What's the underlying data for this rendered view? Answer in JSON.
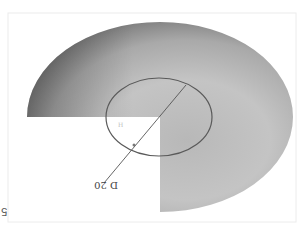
{
  "figure": {
    "orientation": "rotated-180",
    "frame_color": "#e6e6e6",
    "disc": {
      "description": "three-quarter disc with quarter cut-out",
      "shade_dark": "#6e6e6e",
      "shade_mid": "#a8a8a8",
      "shade_light": "#c8c8c8"
    },
    "inner_circle": {
      "stroke_color": "#5a5a5a"
    },
    "dimension": {
      "label": "D 20",
      "line_color": "#555555"
    },
    "corner_number": "5"
  }
}
